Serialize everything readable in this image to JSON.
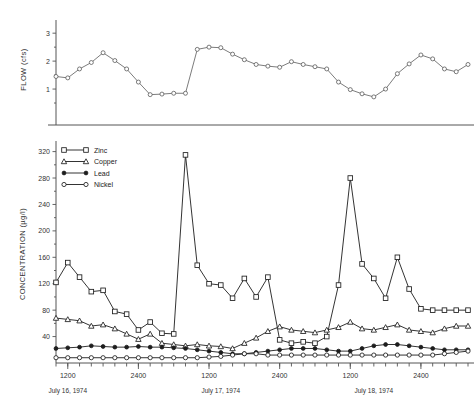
{
  "figure": {
    "panels": [
      "flow-panel",
      "concentration-panel"
    ]
  },
  "flow_axis": {
    "title": "FLOW  (cfs)",
    "ticks": [
      "1",
      "2",
      "3"
    ]
  },
  "conc_axis": {
    "title": "CONCENTRATION  (µg/l)",
    "ticks": [
      "40",
      "80",
      "120",
      "160",
      "200",
      "240",
      "280",
      "320"
    ]
  },
  "time_axis": {
    "ticks": [
      "1200",
      "2400",
      "1200",
      "2400",
      "1200",
      "2400"
    ],
    "dates": [
      "July 16, 1974",
      "July 17, 1974",
      "July 18, 1974"
    ]
  },
  "legend": {
    "title": "",
    "entries": [
      {
        "label": "Zinc",
        "marker": "square-open"
      },
      {
        "label": "Copper",
        "marker": "triangle-open"
      },
      {
        "label": "Lead",
        "marker": "circle-solid"
      },
      {
        "label": "Nickel",
        "marker": "circle-open"
      }
    ]
  },
  "chart_data": [
    {
      "type": "line",
      "id": "flow-panel",
      "title": "",
      "xlabel": "",
      "ylabel": "FLOW  (cfs)",
      "ylim": [
        0,
        3.4
      ],
      "yticks": [
        1,
        2,
        3
      ],
      "grid": false,
      "legend_position": "none",
      "x": [
        0,
        1,
        2,
        3,
        4,
        5,
        6,
        7,
        8,
        9,
        10,
        11,
        12,
        13,
        14,
        15,
        16,
        17,
        18,
        19,
        20,
        21,
        22,
        23,
        24,
        25,
        26,
        27,
        28,
        29,
        30,
        31,
        32,
        33,
        34,
        35
      ],
      "series": [
        {
          "name": "Flow",
          "marker": "circle-open",
          "values": [
            1.45,
            1.4,
            1.72,
            1.95,
            2.3,
            2.02,
            1.72,
            1.25,
            0.8,
            0.82,
            0.85,
            0.85,
            2.42,
            2.5,
            2.48,
            2.25,
            2.05,
            1.88,
            1.82,
            1.78,
            1.98,
            1.88,
            1.8,
            1.72,
            1.25,
            0.98,
            0.83,
            0.72,
            1.0,
            1.55,
            1.9,
            2.22,
            2.08,
            1.72,
            1.62,
            1.88
          ]
        }
      ]
    },
    {
      "type": "line",
      "id": "concentration-panel",
      "title": "",
      "xlabel": "",
      "ylabel": "CONCENTRATION  (µg/l)",
      "ylim": [
        0,
        330
      ],
      "yticks": [
        40,
        80,
        120,
        160,
        200,
        240,
        280,
        320
      ],
      "grid": false,
      "legend_position": "top-left",
      "x": [
        0,
        1,
        2,
        3,
        4,
        5,
        6,
        7,
        8,
        9,
        10,
        11,
        12,
        13,
        14,
        15,
        16,
        17,
        18,
        19,
        20,
        21,
        22,
        23,
        24,
        25,
        26,
        27,
        28,
        29,
        30,
        31,
        32,
        33,
        34,
        35
      ],
      "series": [
        {
          "name": "Zinc",
          "marker": "square-open",
          "values": [
            122,
            152,
            130,
            108,
            110,
            78,
            74,
            50,
            62,
            45,
            44,
            315,
            148,
            120,
            118,
            98,
            128,
            100,
            130,
            35,
            30,
            32,
            30,
            40,
            118,
            280,
            150,
            128,
            98,
            160,
            112,
            82,
            80,
            80,
            80,
            80
          ]
        },
        {
          "name": "Copper",
          "marker": "triangle-open",
          "values": [
            68,
            66,
            64,
            56,
            58,
            52,
            44,
            36,
            44,
            30,
            28,
            26,
            28,
            26,
            25,
            22,
            30,
            38,
            48,
            55,
            50,
            48,
            46,
            50,
            54,
            62,
            52,
            50,
            54,
            58,
            50,
            48,
            46,
            52,
            56,
            56
          ]
        },
        {
          "name": "Lead",
          "marker": "circle-solid",
          "values": [
            22,
            23,
            24,
            26,
            25,
            24,
            24,
            25,
            24,
            24,
            23,
            22,
            20,
            18,
            16,
            14,
            14,
            16,
            18,
            20,
            22,
            22,
            22,
            20,
            18,
            18,
            22,
            26,
            28,
            28,
            26,
            24,
            22,
            20,
            20,
            20
          ]
        },
        {
          "name": "Nickel",
          "marker": "circle-open",
          "values": [
            8,
            8,
            8,
            8,
            8,
            8,
            8,
            8,
            8,
            8,
            8,
            8,
            8,
            9,
            10,
            12,
            14,
            14,
            12,
            12,
            12,
            12,
            12,
            12,
            12,
            12,
            12,
            12,
            12,
            12,
            12,
            12,
            12,
            14,
            16,
            18
          ]
        }
      ]
    }
  ]
}
